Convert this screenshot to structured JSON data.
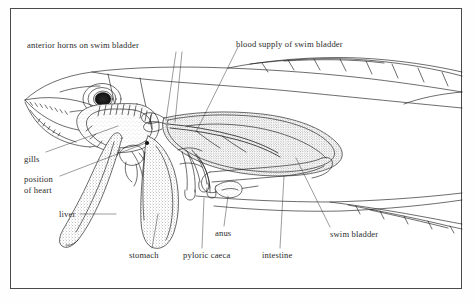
{
  "figure": {
    "background_color": "#ffffff",
    "frame_color": "#4a4a4a",
    "ink_color": "#1e1e1e",
    "text_color": "#2b2b2b"
  },
  "labels": [
    {
      "id": "anterior-horns",
      "text": "anterior horns on swim bladder",
      "x": 27,
      "y": 40
    },
    {
      "id": "blood-supply",
      "text": "blood supply of swim bladder",
      "x": 236,
      "y": 39
    },
    {
      "id": "gills",
      "text": "gills",
      "x": 24,
      "y": 154
    },
    {
      "id": "position-of-heart-line1",
      "text": "position",
      "x": 24,
      "y": 174
    },
    {
      "id": "position-of-heart-line2",
      "text": "of heart",
      "x": 24,
      "y": 185
    },
    {
      "id": "liver",
      "text": "liver",
      "x": 59,
      "y": 216
    },
    {
      "id": "stomach",
      "text": "stomach",
      "x": 129,
      "y": 252
    },
    {
      "id": "pyloric-caeca",
      "text": "pyloric caeca",
      "x": 183,
      "y": 252
    },
    {
      "id": "anus",
      "text": "anus",
      "x": 215,
      "y": 230
    },
    {
      "id": "intestine",
      "text": "intestine",
      "x": 262,
      "y": 252
    },
    {
      "id": "swim-bladder",
      "text": "swim bladder",
      "x": 330,
      "y": 231
    }
  ],
  "structures": [
    {
      "id": "head",
      "name": "fish head with open jaw and teeth"
    },
    {
      "id": "eye",
      "name": "eye with dark stippled pupil"
    },
    {
      "id": "gill-arch",
      "name": "gill arch with filaments"
    },
    {
      "id": "heart",
      "name": "position of heart"
    },
    {
      "id": "liver",
      "name": "liver lobe"
    },
    {
      "id": "stomach",
      "name": "stomach"
    },
    {
      "id": "pyloric-caeca",
      "name": "pyloric caeca finger-like projections"
    },
    {
      "id": "intestine",
      "name": "intestine"
    },
    {
      "id": "anus",
      "name": "anus / vent"
    },
    {
      "id": "swim-bladder",
      "name": "swim bladder stippled sac"
    },
    {
      "id": "blood-supply",
      "name": "blood vessel supplying swim bladder"
    },
    {
      "id": "anterior-horns",
      "name": "anterior horns of swim bladder"
    },
    {
      "id": "body-outline",
      "name": "fish body outline with dorsal and anal fins"
    }
  ]
}
